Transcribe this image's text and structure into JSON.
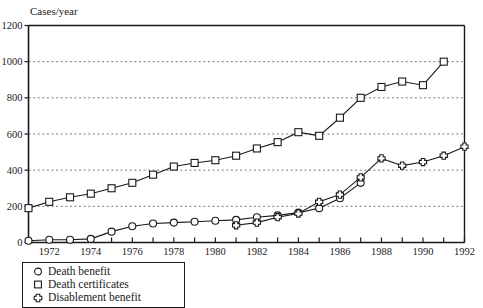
{
  "chart_data": {
    "type": "line",
    "title": "",
    "xlabel": "",
    "ylabel": "Cases/year",
    "xlim": [
      1971,
      1992
    ],
    "ylim": [
      0,
      1200
    ],
    "grid": true,
    "legend_position": "below-left",
    "y_ticks": [
      0,
      200,
      400,
      600,
      800,
      1000,
      1200
    ],
    "y_tick_labels": [
      "0",
      "200",
      "400",
      "600",
      "800",
      "1000",
      "1200"
    ],
    "x_ticks": [
      1971,
      1972,
      1973,
      1974,
      1975,
      1976,
      1977,
      1978,
      1979,
      1980,
      1981,
      1982,
      1983,
      1984,
      1985,
      1986,
      1987,
      1988,
      1989,
      1990,
      1991,
      1992
    ],
    "x_tick_labels": [
      "",
      "1972",
      "",
      "1974",
      "",
      "1976",
      "",
      "1978",
      "",
      "1980",
      "",
      "1982",
      "",
      "1984",
      "",
      "1986",
      "",
      "1988",
      "",
      "1990",
      "",
      "1992"
    ],
    "series": [
      {
        "name": "Death benefit",
        "marker": "circle",
        "x": [
          1971,
          1972,
          1973,
          1974,
          1975,
          1976,
          1977,
          1978,
          1979,
          1980,
          1981,
          1982,
          1983,
          1984,
          1985,
          1986,
          1987
        ],
        "values": [
          10,
          15,
          15,
          20,
          60,
          90,
          105,
          110,
          115,
          120,
          125,
          140,
          150,
          165,
          190,
          245,
          330
        ]
      },
      {
        "name": "Death certificates",
        "marker": "square",
        "x": [
          1971,
          1972,
          1973,
          1974,
          1975,
          1976,
          1977,
          1978,
          1979,
          1980,
          1981,
          1982,
          1983,
          1984,
          1985,
          1986,
          1987,
          1988,
          1989,
          1990,
          1991
        ],
        "values": [
          190,
          225,
          250,
          270,
          300,
          330,
          375,
          420,
          440,
          455,
          480,
          520,
          555,
          610,
          590,
          690,
          800,
          860,
          890,
          870,
          1000
        ]
      },
      {
        "name": "Disablement benefit",
        "marker": "cross-circle",
        "x": [
          1981,
          1982,
          1983,
          1984,
          1985,
          1986,
          1987,
          1988,
          1989,
          1990,
          1991,
          1992
        ],
        "values": [
          95,
          110,
          140,
          160,
          225,
          265,
          360,
          465,
          425,
          445,
          480,
          530
        ]
      }
    ]
  },
  "legend": {
    "items": [
      {
        "label": "Death benefit",
        "marker": "circle"
      },
      {
        "label": "Death certificates",
        "marker": "square"
      },
      {
        "label": "Disablement benefit",
        "marker": "cross-circle"
      }
    ]
  }
}
